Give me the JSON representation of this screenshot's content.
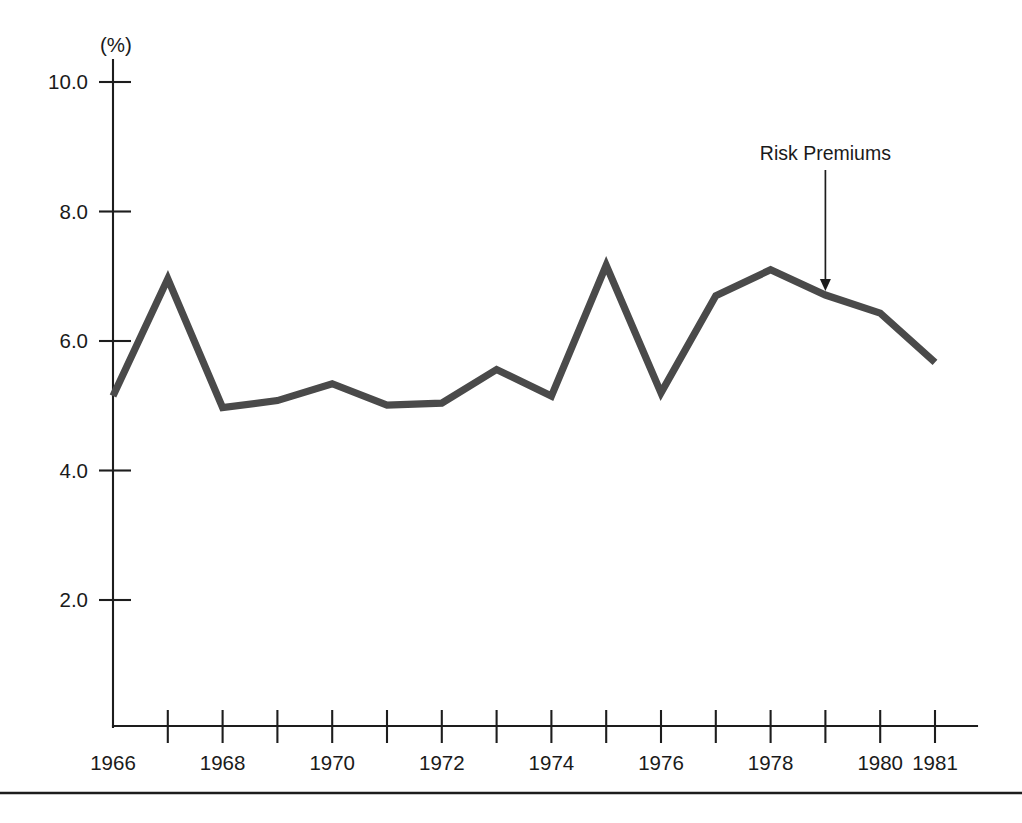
{
  "figure": {
    "unit_label": "(%)",
    "background_color": "#ffffff",
    "line_color": "#4a4a4a",
    "axis_color": "#1d1d1d",
    "text_color": "#1a1a1a"
  },
  "annotations": [
    {
      "name": "risk-premiums",
      "text": "Risk Premiums",
      "points_to_year": 1979,
      "points_to_value": 6.71
    }
  ],
  "chart_data": {
    "type": "line",
    "title": "",
    "subtitle": "",
    "xlabel": "",
    "ylabel": "(%)",
    "grid": false,
    "legend": "none",
    "x": [
      1966,
      1967,
      1968,
      1969,
      1970,
      1971,
      1972,
      1973,
      1974,
      1975,
      1976,
      1977,
      1978,
      1979,
      1980,
      1981
    ],
    "xlim": [
      1966,
      1981
    ],
    "x_tick_labels": [
      "1966",
      "1968",
      "1970",
      "1972",
      "1974",
      "1976",
      "1978",
      "1980",
      "1981"
    ],
    "x_tick_values": [
      1966,
      1968,
      1970,
      1972,
      1974,
      1976,
      1978,
      1980,
      1981
    ],
    "x_minor_tick_values": [
      1967,
      1969,
      1971,
      1973,
      1975,
      1977,
      1979
    ],
    "ylim": [
      0.0,
      10.0
    ],
    "y_tick_labels": [
      "10.0",
      "8.0",
      "6.0",
      "4.0",
      "2.0"
    ],
    "y_tick_values": [
      10.0,
      8.0,
      6.0,
      4.0,
      2.0
    ],
    "series": [
      {
        "name": "Risk Premiums",
        "values": [
          5.15,
          6.96,
          4.97,
          5.08,
          5.34,
          5.01,
          5.04,
          5.56,
          5.15,
          7.17,
          5.2,
          6.7,
          7.1,
          6.71,
          6.43,
          5.67
        ]
      }
    ]
  }
}
